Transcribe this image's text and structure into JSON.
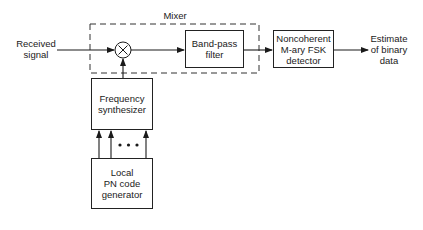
{
  "diagram": {
    "inputs": {
      "received_signal": [
        "Received",
        "signal"
      ]
    },
    "mixer": {
      "label": "Mixer",
      "multiplier_symbol": "×"
    },
    "blocks": {
      "bandpass_filter": [
        "Band-pass",
        "filter"
      ],
      "detector": [
        "Noncoherent",
        "M-ary FSK",
        "detector"
      ],
      "frequency_synthesizer": [
        "Frequency",
        "synthesizer"
      ],
      "pn_generator": [
        "Local",
        "PN code",
        "generator"
      ]
    },
    "outputs": {
      "estimate": [
        "Estimate",
        "of binary",
        "data"
      ]
    },
    "ellipsis": "• • •"
  }
}
